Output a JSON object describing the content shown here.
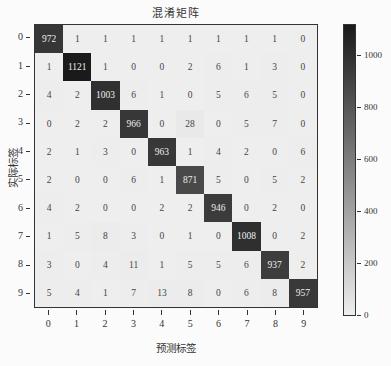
{
  "chart_data": {
    "type": "heatmap",
    "title": "混淆矩阵",
    "xlabel": "预测标签",
    "ylabel": "实际标签",
    "x_categories": [
      "0",
      "1",
      "2",
      "3",
      "4",
      "5",
      "6",
      "7",
      "8",
      "9"
    ],
    "y_categories": [
      "0",
      "1",
      "2",
      "3",
      "4",
      "5",
      "6",
      "7",
      "8",
      "9"
    ],
    "matrix": [
      [
        972,
        1,
        1,
        1,
        1,
        1,
        1,
        1,
        1,
        0
      ],
      [
        1,
        1121,
        1,
        0,
        0,
        2,
        6,
        1,
        3,
        0
      ],
      [
        4,
        2,
        1003,
        6,
        1,
        0,
        5,
        6,
        5,
        0
      ],
      [
        0,
        2,
        2,
        966,
        0,
        28,
        0,
        5,
        7,
        0
      ],
      [
        2,
        1,
        3,
        0,
        963,
        1,
        4,
        2,
        0,
        6
      ],
      [
        2,
        0,
        0,
        6,
        1,
        871,
        5,
        0,
        5,
        2
      ],
      [
        4,
        2,
        0,
        0,
        2,
        2,
        946,
        0,
        2,
        0
      ],
      [
        1,
        5,
        8,
        3,
        0,
        1,
        0,
        1008,
        0,
        2
      ],
      [
        3,
        0,
        4,
        11,
        1,
        5,
        5,
        6,
        937,
        2
      ],
      [
        5,
        4,
        1,
        7,
        13,
        8,
        0,
        6,
        8,
        957
      ]
    ],
    "colorbar": {
      "min": 0,
      "max": 1121,
      "ticks": [
        0,
        200,
        400,
        600,
        800,
        1000
      ],
      "colormap": "Greys"
    }
  }
}
